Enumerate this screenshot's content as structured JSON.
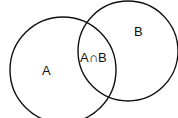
{
  "diagram": {
    "type": "venn",
    "sets": [
      {
        "id": "A",
        "label": "A",
        "cx": 63,
        "cy": 70,
        "r": 53
      },
      {
        "id": "B",
        "label": "B",
        "cx": 128,
        "cy": 51,
        "r": 50
      }
    ],
    "intersection": {
      "label": "A∩B"
    },
    "stroke_color": "#111111",
    "background": "#ffffff"
  }
}
